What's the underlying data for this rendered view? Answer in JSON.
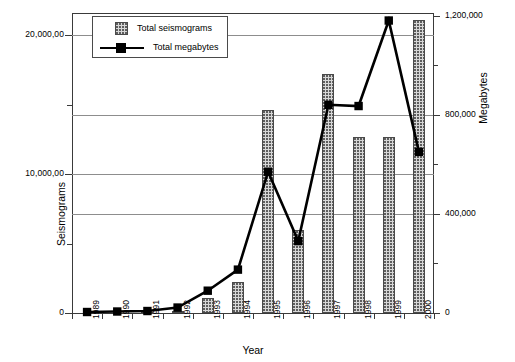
{
  "chart_data": {
    "type": "bar",
    "title": "",
    "xlabel": "Year",
    "ylabel": "Seismograms",
    "ylabel_right": "Megabytes",
    "categories": [
      "1989",
      "1990",
      "1991",
      "1992",
      "1993",
      "1994",
      "1995",
      "1996",
      "1997",
      "1998",
      "1999",
      "2000"
    ],
    "ylim": [
      0,
      25000
    ],
    "ylim_right": [
      0,
      1400000
    ],
    "yticks_left": [
      "0",
      "10,000,00",
      "20,000,00"
    ],
    "ytick_values_left": [
      0,
      10000,
      20000
    ],
    "yticks_right": [
      "0",
      "400,000",
      "800,000",
      "1,200,000"
    ],
    "ytick_values_right": [
      0,
      400000,
      800000,
      1200000
    ],
    "grid": true,
    "legend_position": "top-left",
    "series": [
      {
        "name": "Total seismograms",
        "axis": "left",
        "render": "bar",
        "values": [
          40,
          40,
          50,
          120,
          1100,
          2200,
          14600,
          6000,
          17200,
          12700,
          12700,
          21100
        ]
      },
      {
        "name": "Total megabytes",
        "axis": "right",
        "render": "line",
        "values": [
          4000,
          6000,
          8000,
          22000,
          90000,
          175000,
          570000,
          290000,
          840000,
          835000,
          1180000,
          650000
        ]
      }
    ]
  },
  "legend": {
    "entries": [
      {
        "label": "Total seismograms",
        "swatch": "hatched-bar-swatch"
      },
      {
        "label": "Total megabytes",
        "swatch": "line-marker-swatch"
      }
    ]
  }
}
